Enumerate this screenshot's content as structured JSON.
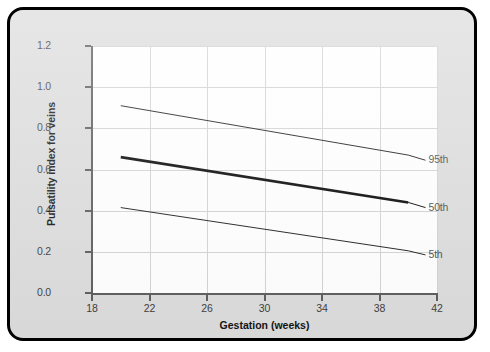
{
  "figure": {
    "background_color": "#dcdcdc",
    "plot_background_color": "#ffffff",
    "border_color": "#000000"
  },
  "chart_data": {
    "type": "line",
    "title": "",
    "xlabel": "Gestation (weeks)",
    "ylabel": "Pulsatility index for veins",
    "xlim": [
      18,
      42
    ],
    "ylim": [
      0.0,
      1.2
    ],
    "xticks": [
      18,
      22,
      26,
      30,
      34,
      38,
      42
    ],
    "xtick_labels": [
      "18",
      "22",
      "26",
      "30",
      "34",
      "38",
      "42"
    ],
    "yticks": [
      0.0,
      0.2,
      0.4,
      0.6,
      0.8,
      1.0,
      1.2
    ],
    "ytick_labels": [
      "0.0",
      "0.2",
      "0.4",
      "0.6",
      "0.8",
      "1.0",
      "1.2"
    ],
    "grid": true,
    "grid_color": "#d2d2d2",
    "legend_position": "right-inline-annotations",
    "x": [
      20,
      40
    ],
    "series": [
      {
        "name": "95th",
        "label": "95th",
        "values": [
          0.91,
          0.67
        ],
        "line_width": 1,
        "color": "#1a1a1a",
        "label_x": 41.2,
        "label_y": 0.645
      },
      {
        "name": "50th",
        "label": "50th",
        "values": [
          0.66,
          0.44
        ],
        "line_width": 2.6,
        "color": "#000000",
        "label_x": 41.2,
        "label_y": 0.415
      },
      {
        "name": "5th",
        "label": "5th",
        "values": [
          0.415,
          0.205
        ],
        "line_width": 1,
        "color": "#1a1a1a",
        "label_x": 41.2,
        "label_y": 0.185
      }
    ]
  }
}
